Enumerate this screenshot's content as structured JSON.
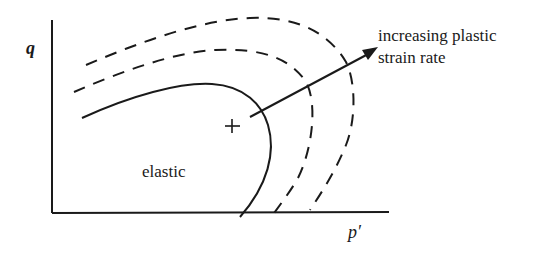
{
  "diagram": {
    "axes": {
      "y_label": "q",
      "x_label": "p′"
    },
    "regions": {
      "elastic_label": "elastic"
    },
    "annotations": {
      "arrow_label_line1": "increasing plastic",
      "arrow_label_line2": "strain rate",
      "center_marker": "+"
    },
    "curves": [
      {
        "name": "yield-surface",
        "style": "solid"
      },
      {
        "name": "loading-surface-1",
        "style": "dashed"
      },
      {
        "name": "loading-surface-2",
        "style": "dashed"
      }
    ],
    "colors": {
      "ink": "#1a1a1a",
      "background": "#ffffff"
    }
  }
}
